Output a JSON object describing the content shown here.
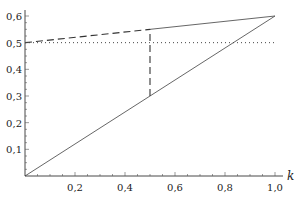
{
  "chart_data": {
    "type": "line",
    "title": "",
    "xlabel": "k",
    "ylabel": "",
    "xlim": [
      0,
      1.0
    ],
    "ylim": [
      0,
      0.6
    ],
    "grid": false,
    "legend": null,
    "x_ticks": [
      "0,2",
      "0,4",
      "0,6",
      "0,8",
      "1,0"
    ],
    "y_ticks": [
      "0,1",
      "0,2",
      "0,3",
      "0,4",
      "0,5",
      "0,6"
    ],
    "series": [
      {
        "name": "diagonal",
        "style": "solid",
        "x": [
          0,
          1.0
        ],
        "values": [
          0,
          0.6
        ]
      },
      {
        "name": "upper-line-dashed",
        "style": "dashed",
        "x": [
          0,
          0.5
        ],
        "values": [
          0.5,
          0.55
        ]
      },
      {
        "name": "upper-line-solid",
        "style": "solid",
        "x": [
          0.5,
          1.0
        ],
        "values": [
          0.55,
          0.6
        ]
      },
      {
        "name": "horizontal-0.5",
        "style": "dotted",
        "x": [
          0,
          1.0
        ],
        "values": [
          0.5,
          0.5
        ]
      },
      {
        "name": "vertical-k-0.5",
        "style": "dashed",
        "x": [
          0.5,
          0.5
        ],
        "values": [
          0.3,
          0.55
        ]
      }
    ]
  }
}
